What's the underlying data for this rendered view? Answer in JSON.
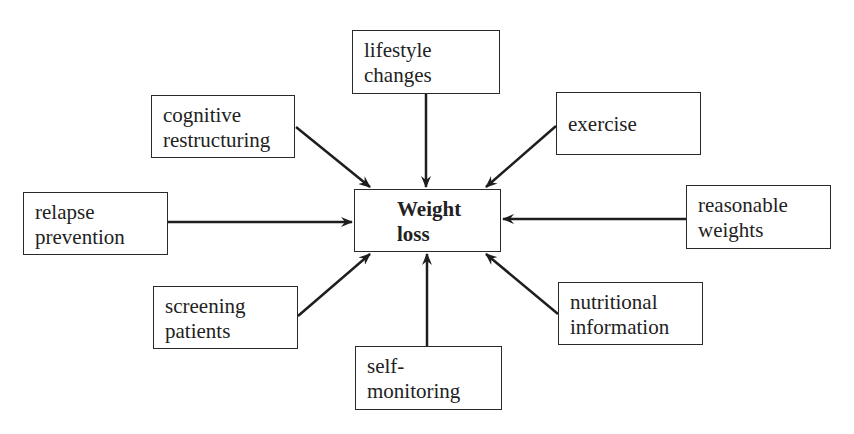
{
  "diagram": {
    "center": {
      "id": "weight-loss",
      "lines": [
        "Weight",
        "loss"
      ],
      "box": [
        354,
        189,
        147,
        63
      ]
    },
    "nodes": [
      {
        "id": "lifestyle-changes",
        "lines": [
          "lifestyle",
          "changes"
        ],
        "box": [
          352,
          30,
          148,
          64
        ]
      },
      {
        "id": "cognitive-restructuring",
        "lines": [
          "cognitive",
          "restructuring"
        ],
        "box": [
          151,
          95,
          144,
          63
        ]
      },
      {
        "id": "exercise",
        "lines": [
          "exercise",
          ""
        ],
        "box": [
          556,
          92,
          145,
          63
        ]
      },
      {
        "id": "relapse-prevention",
        "lines": [
          "relapse",
          "prevention"
        ],
        "box": [
          23,
          192,
          145,
          63
        ]
      },
      {
        "id": "reasonable-weights",
        "lines": [
          "reasonable",
          "weights"
        ],
        "box": [
          686,
          185,
          145,
          64
        ]
      },
      {
        "id": "screening-patients",
        "lines": [
          "screening",
          "patients"
        ],
        "box": [
          153,
          286,
          145,
          63
        ]
      },
      {
        "id": "nutritional-information",
        "lines": [
          "nutritional",
          "information"
        ],
        "box": [
          558,
          282,
          145,
          63
        ]
      },
      {
        "id": "self-monitoring",
        "lines": [
          "self-",
          "monitoring"
        ],
        "box": [
          355,
          346,
          147,
          64
        ]
      }
    ],
    "edges": [
      {
        "from": "lifestyle-changes",
        "to": "weight-loss",
        "x1": 426,
        "y1": 94,
        "x2": 426,
        "y2": 187
      },
      {
        "from": "cognitive-restructuring",
        "to": "weight-loss",
        "x1": 296,
        "y1": 127,
        "x2": 370,
        "y2": 187
      },
      {
        "from": "exercise",
        "to": "weight-loss",
        "x1": 556,
        "y1": 126,
        "x2": 486,
        "y2": 187
      },
      {
        "from": "relapse-prevention",
        "to": "weight-loss",
        "x1": 168,
        "y1": 222,
        "x2": 352,
        "y2": 222
      },
      {
        "from": "reasonable-weights",
        "to": "weight-loss",
        "x1": 686,
        "y1": 219,
        "x2": 503,
        "y2": 219
      },
      {
        "from": "screening-patients",
        "to": "weight-loss",
        "x1": 298,
        "y1": 316,
        "x2": 370,
        "y2": 254
      },
      {
        "from": "nutritional-information",
        "to": "weight-loss",
        "x1": 558,
        "y1": 314,
        "x2": 486,
        "y2": 254
      },
      {
        "from": "self-monitoring",
        "to": "weight-loss",
        "x1": 427,
        "y1": 346,
        "x2": 427,
        "y2": 254
      }
    ],
    "colors": {
      "stroke": "#1e1e1e",
      "text": "#222222",
      "background": "#ffffff"
    }
  }
}
